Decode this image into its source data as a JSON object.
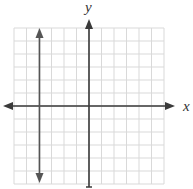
{
  "graph": {
    "x_axis_label": "x",
    "y_axis_label": "y",
    "grid": {
      "columns": 12,
      "rows": 12,
      "color": "#d9d9d9"
    },
    "axes_color": "#3a3a3a",
    "line": {
      "type": "vertical",
      "equation": "x = -4",
      "color": "#555555"
    }
  },
  "chart_data": {
    "type": "line",
    "title": "",
    "xlabel": "x",
    "ylabel": "y",
    "xlim": [
      -6,
      6
    ],
    "ylim": [
      -6,
      6
    ],
    "grid": true,
    "series": [
      {
        "name": "x = -4",
        "x": [
          -4,
          -4
        ],
        "y": [
          -6,
          6
        ]
      }
    ]
  }
}
